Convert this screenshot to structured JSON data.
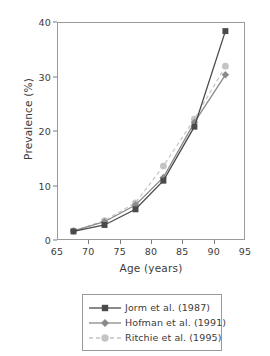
{
  "chart_data": {
    "type": "line",
    "title": "",
    "xlabel": "Age (years)",
    "ylabel": "Prevalence (%)",
    "xlim": [
      65,
      95
    ],
    "ylim": [
      0,
      40
    ],
    "xticks": [
      65,
      70,
      75,
      80,
      85,
      90,
      95
    ],
    "yticks": [
      0,
      10,
      20,
      30,
      40
    ],
    "grid": false,
    "legend_position": "below-plot",
    "x": [
      67.5,
      72.5,
      77.5,
      82,
      87,
      92
    ],
    "series": [
      {
        "name": "Jorm et al. (1987)",
        "values": [
          1.4,
          2.6,
          5.5,
          10.8,
          20.8,
          38.5
        ],
        "color": "#4a4a4a",
        "marker": "square",
        "linestyle": "solid"
      },
      {
        "name": "Hofman et al. (1991)",
        "values": [
          1.5,
          3.2,
          6.3,
          11.4,
          21.6,
          30.4
        ],
        "color": "#8a8a8a",
        "marker": "diamond",
        "linestyle": "solid"
      },
      {
        "name": "Ritchie et al. (1995)",
        "values": [
          1.5,
          3.4,
          6.7,
          13.5,
          22.2,
          32.0
        ],
        "color": "#c4c4c4",
        "marker": "circle",
        "linestyle": "dashed"
      }
    ]
  },
  "legend": {
    "entries": [
      {
        "label": "Jorm et al. (1987)"
      },
      {
        "label": "Hofman et al. (1991)"
      },
      {
        "label": "Ritchie et al. (1995)"
      }
    ]
  },
  "axes": {
    "x_tick_labels": [
      "65",
      "70",
      "75",
      "80",
      "85",
      "90",
      "95"
    ],
    "y_tick_labels": [
      "0",
      "10",
      "20",
      "30",
      "40"
    ]
  }
}
